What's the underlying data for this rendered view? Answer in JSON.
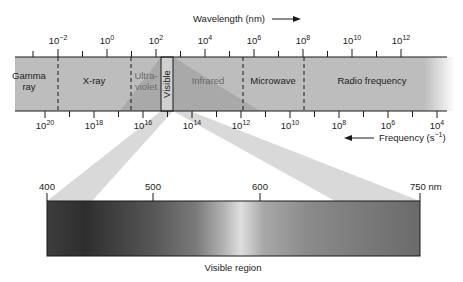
{
  "wavelength_axis": {
    "label": "Wavelength (nm)",
    "direction": "increasing-right",
    "ticks": [
      {
        "base": "10",
        "exp": "−2",
        "x": 58
      },
      {
        "base": "10",
        "exp": "0",
        "x": 107
      },
      {
        "base": "10",
        "exp": "2",
        "x": 156
      },
      {
        "base": "10",
        "exp": "4",
        "x": 205
      },
      {
        "base": "10",
        "exp": "6",
        "x": 254
      },
      {
        "base": "10",
        "exp": "8",
        "x": 303
      },
      {
        "base": "10",
        "exp": "10",
        "x": 352
      },
      {
        "base": "10",
        "exp": "12",
        "x": 401
      }
    ]
  },
  "frequency_axis": {
    "label": "Frequency (s",
    "label_exp": "−1",
    "label_close": ")",
    "direction": "increasing-left",
    "ticks": [
      {
        "base": "10",
        "exp": "20",
        "x": 45
      },
      {
        "base": "10",
        "exp": "18",
        "x": 94
      },
      {
        "base": "10",
        "exp": "16",
        "x": 143
      },
      {
        "base": "10",
        "exp": "14",
        "x": 192
      },
      {
        "base": "10",
        "exp": "12",
        "x": 241
      },
      {
        "base": "10",
        "exp": "10",
        "x": 290
      },
      {
        "base": "10",
        "exp": "8",
        "x": 339
      },
      {
        "base": "10",
        "exp": "6",
        "x": 388
      },
      {
        "base": "10",
        "exp": "4",
        "x": 437
      }
    ]
  },
  "regions": [
    {
      "name": "Gamma ray",
      "lines": [
        "Gamma",
        "ray"
      ],
      "cx": 29
    },
    {
      "name": "X-ray",
      "lines": [
        "X-ray"
      ],
      "cx": 94
    },
    {
      "name": "Ultraviolet",
      "lines": [
        "Ultra-",
        "violet"
      ],
      "cx": 146
    },
    {
      "name": "Visible",
      "lines": [
        "Visible"
      ],
      "cx": 167
    },
    {
      "name": "Infrared",
      "lines": [
        "Infrared"
      ],
      "cx": 208
    },
    {
      "name": "Microwave",
      "lines": [
        "Microwave"
      ],
      "cx": 273
    },
    {
      "name": "Radio frequency",
      "lines": [
        "Radio frequency"
      ],
      "cx": 372
    }
  ],
  "boundaries_x": [
    58,
    131,
    243,
    304
  ],
  "visible_region": {
    "label": "Visible region",
    "ticks": [
      {
        "label": "400",
        "x": 47
      },
      {
        "label": "500",
        "x": 153
      },
      {
        "label": "600",
        "x": 260
      },
      {
        "label": "750 nm",
        "x": 420
      }
    ]
  },
  "colors": {
    "band": "#bdbdbd",
    "cone": "#a9a9a9",
    "projection": "#d9d9d9",
    "axis": "#1a1a1a"
  }
}
